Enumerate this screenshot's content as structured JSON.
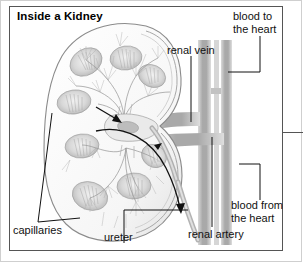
{
  "figure": {
    "title": "Inside a Kidney",
    "width": 303,
    "height": 263,
    "kind": "anatomical-diagram"
  },
  "labels": {
    "renal_vein": "renal vein",
    "renal_artery": "renal artery",
    "ureter": "ureter",
    "capillaries": "capillaries",
    "blood_to_heart_line1": "blood to",
    "blood_to_heart_line2": "the heart",
    "blood_from_heart_line1": "blood from",
    "blood_from_heart_line2": "the heart"
  },
  "colors": {
    "ink": "#111111",
    "frame": "#555555",
    "outer_frame": "#cfcfcf",
    "background": "#ffffff",
    "drawing_light": "#b9b9b9",
    "drawing_mid": "#8e8e8e",
    "drawing_dark": "#6b6b6b",
    "vessel": "#b5b5b5"
  },
  "annotations": {
    "arrow_upper": "blood flow arrow into kidney (upper lobe)",
    "arrow_curved": "curved blood flow arrow down toward ureter"
  }
}
